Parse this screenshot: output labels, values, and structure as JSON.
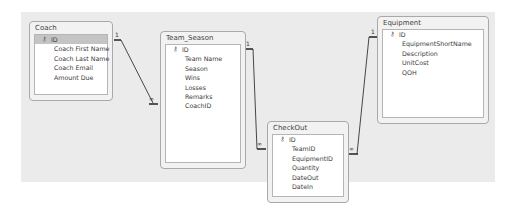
{
  "tables": [
    {
      "name": "Coach",
      "fields": [
        {
          "label": "ID",
          "primary_key": true,
          "selected": true
        },
        {
          "label": "Coach First Name"
        },
        {
          "label": "Coach Last Name"
        },
        {
          "label": "Coach Email"
        },
        {
          "label": "Amount Due"
        }
      ]
    },
    {
      "name": "Team_Season",
      "fields": [
        {
          "label": "ID",
          "primary_key": true
        },
        {
          "label": "Team Name"
        },
        {
          "label": "Season"
        },
        {
          "label": "Wins"
        },
        {
          "label": "Losses"
        },
        {
          "label": "Remarks"
        },
        {
          "label": "CoachID"
        }
      ]
    },
    {
      "name": "CheckOut",
      "fields": [
        {
          "label": "ID",
          "primary_key": true
        },
        {
          "label": "TeamID"
        },
        {
          "label": "EquipmentID"
        },
        {
          "label": "Quantity"
        },
        {
          "label": "DateOut"
        },
        {
          "label": "DateIn"
        }
      ]
    },
    {
      "name": "Equipment",
      "fields": [
        {
          "label": "ID",
          "primary_key": true
        },
        {
          "label": "EquipmentShortName"
        },
        {
          "label": "Description"
        },
        {
          "label": "UnitCost"
        },
        {
          "label": "QOH"
        }
      ]
    }
  ],
  "relationships": [
    {
      "from": "Coach.ID",
      "to": "Team_Season.CoachID",
      "one_label": "1",
      "many_label": "∞"
    },
    {
      "from": "Team_Season.ID",
      "to": "CheckOut.TeamID",
      "one_label": "1",
      "many_label": "∞"
    },
    {
      "from": "Equipment.ID",
      "to": "CheckOut.EquipmentID",
      "one_label": "1",
      "many_label": "∞"
    }
  ],
  "icons": {
    "primary_key": "⚷"
  }
}
